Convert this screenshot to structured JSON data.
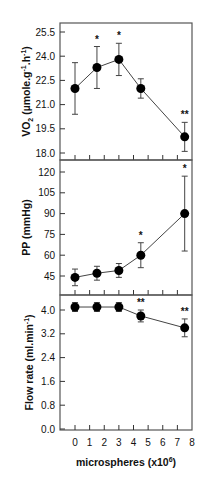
{
  "chart_data": [
    {
      "type": "line",
      "panel": "top",
      "ylabel": "VO2 (µmole.g-1.h-1)",
      "ylabel_parts": {
        "main": "VO",
        "sub": "2",
        "rest": " (µmole.g",
        "sup1": "-1",
        "mid": ".h",
        "sup2": "-1",
        "end": ")"
      },
      "ylim": [
        18.0,
        25.5
      ],
      "yticks": [
        "18.0",
        "19.5",
        "21.0",
        "22.5",
        "24.0",
        "25.5"
      ],
      "x": [
        0,
        1.5,
        3,
        4.5,
        7.5
      ],
      "values": [
        22.0,
        23.3,
        23.8,
        22.0,
        19.0
      ],
      "errors": [
        1.6,
        1.3,
        1.0,
        0.6,
        0.9
      ],
      "significance": [
        "",
        "*",
        "*",
        "",
        "**"
      ],
      "grid": false
    },
    {
      "type": "line",
      "panel": "middle",
      "ylabel": "PP (mmHg)",
      "ylim": [
        35,
        128
      ],
      "yticks": [
        "45",
        "60",
        "75",
        "90",
        "105",
        "120"
      ],
      "x": [
        0,
        1.5,
        3,
        4.5,
        7.5
      ],
      "values": [
        44,
        47,
        49,
        60,
        90
      ],
      "errors": [
        6,
        5,
        5,
        9,
        27
      ],
      "significance": [
        "",
        "",
        "",
        "*",
        "*"
      ],
      "grid": false
    },
    {
      "type": "line",
      "panel": "bottom",
      "ylabel": "Flow rate (ml.min-1)",
      "ylabel_parts": {
        "main": "Flow rate (ml.min",
        "sup": "-1",
        "end": ")"
      },
      "ylim": [
        0.0,
        4.6
      ],
      "yticks": [
        "0.0",
        "0.8",
        "1.6",
        "2.4",
        "3.2",
        "4.0"
      ],
      "x": [
        0,
        1.5,
        3,
        4.5,
        7.5
      ],
      "values": [
        4.1,
        4.1,
        4.1,
        3.8,
        3.4
      ],
      "errors": [
        0.15,
        0.15,
        0.15,
        0.2,
        0.3
      ],
      "significance": [
        "",
        "",
        "",
        "**",
        "**"
      ],
      "xlabel": "microspheres (x10^6)",
      "xlabel_parts": {
        "main": "microspheres (x10",
        "sup": "6",
        "end": ")"
      },
      "xticks": [
        "0",
        "1",
        "2",
        "3",
        "4",
        "5",
        "6",
        "7",
        "8"
      ],
      "xlim": [
        -1,
        8
      ],
      "grid": false
    }
  ],
  "colors": {
    "line": "#444444",
    "marker": "#000000",
    "frame": "#555555"
  }
}
